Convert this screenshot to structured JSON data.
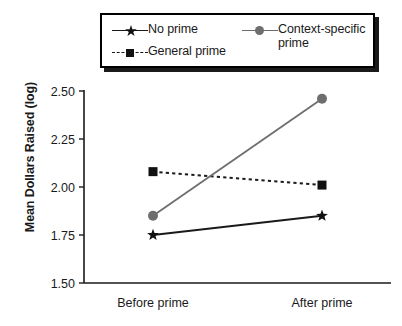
{
  "chart_data": {
    "type": "line",
    "title": "",
    "xlabel": "",
    "ylabel": "Mean Dollars Raised (log)",
    "categories": [
      "Before prime",
      "After prime"
    ],
    "ylim": [
      1.5,
      2.5
    ],
    "yticks": [
      "1.50",
      "1.75",
      "2.00",
      "2.25",
      "2.50"
    ],
    "ytick_values": [
      1.5,
      1.75,
      2.0,
      2.25,
      2.5
    ],
    "grid": false,
    "legend_position": "top",
    "series": [
      {
        "name": "No prime",
        "values": [
          1.75,
          1.85
        ],
        "marker": "star",
        "linestyle": "solid",
        "color": "#1a1a1a"
      },
      {
        "name": "General prime",
        "values": [
          2.08,
          2.01
        ],
        "marker": "square",
        "linestyle": "dashed",
        "color": "#1a1a1a"
      },
      {
        "name": "Context-specific prime",
        "values": [
          1.85,
          2.46
        ],
        "marker": "circle",
        "linestyle": "solid",
        "color": "#6e6e6e"
      }
    ]
  },
  "legend": {
    "entries": [
      {
        "label": "No prime",
        "marker": "star-marker-icon"
      },
      {
        "label": "General prime",
        "marker": "square-marker-icon"
      },
      {
        "label": "Context-specific\nprime",
        "marker": "circle-marker-icon"
      }
    ]
  },
  "axes": {
    "y_axis_title": "Mean Dollars Raised (log)",
    "y_ticks": [
      "2.50",
      "2.25",
      "2.00",
      "1.75",
      "1.50"
    ],
    "x_ticks": [
      "Before prime",
      "After prime"
    ]
  },
  "colors": {
    "black": "#1a1a1a",
    "gray": "#6e6e6e",
    "background": "#ffffff"
  }
}
